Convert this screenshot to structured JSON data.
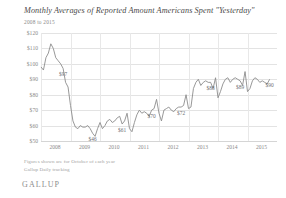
{
  "header": {
    "title": "Monthly Averages of Reported Amount Americans Spent \"Yesterday\"",
    "subtitle": "2008 to 2015"
  },
  "footer": {
    "note1": "Figures shown are for October of each year",
    "note2": "Gallup Daily tracking",
    "logo": "GALLUP"
  },
  "style": {
    "line_color": "#8c8c8c",
    "grid_color": "#e3e3e3",
    "text_color": "#6d6e71"
  },
  "chart_data": {
    "type": "line",
    "title": "Monthly Averages of Reported Amount Americans Spent \"Yesterday\"",
    "subtitle": "2008 to 2015",
    "xlabel": "",
    "ylabel": "",
    "ylim": [
      50,
      120
    ],
    "yticks": [
      50,
      60,
      70,
      80,
      90,
      100,
      110,
      120
    ],
    "ytick_labels": [
      "$50",
      "$60",
      "$70",
      "$80",
      "$90",
      "$100",
      "$110",
      "$120"
    ],
    "xticks": [
      2008,
      2009,
      2010,
      2011,
      2012,
      2013,
      2014,
      2015
    ],
    "xtick_labels": [
      "2008",
      "2009",
      "2010",
      "2011",
      "2012",
      "2013",
      "2014",
      "2015"
    ],
    "grid": "horizontal-and-vertical",
    "legend": "none",
    "series": [
      {
        "name": "Monthly average amount spent yesterday",
        "x": [
          2008.0,
          2008.083,
          2008.167,
          2008.25,
          2008.333,
          2008.417,
          2008.5,
          2008.583,
          2008.667,
          2008.75,
          2008.833,
          2008.917,
          2009.0,
          2009.083,
          2009.167,
          2009.25,
          2009.333,
          2009.417,
          2009.5,
          2009.583,
          2009.667,
          2009.75,
          2009.833,
          2009.917,
          2010.0,
          2010.083,
          2010.167,
          2010.25,
          2010.333,
          2010.417,
          2010.5,
          2010.583,
          2010.667,
          2010.75,
          2010.833,
          2010.917,
          2011.0,
          2011.083,
          2011.167,
          2011.25,
          2011.333,
          2011.417,
          2011.5,
          2011.583,
          2011.667,
          2011.75,
          2011.833,
          2011.917,
          2012.0,
          2012.083,
          2012.167,
          2012.25,
          2012.333,
          2012.417,
          2012.5,
          2012.583,
          2012.667,
          2012.75,
          2012.833,
          2012.917,
          2013.0,
          2013.083,
          2013.167,
          2013.25,
          2013.333,
          2013.417,
          2013.5,
          2013.583,
          2013.667,
          2013.75,
          2013.833,
          2013.917,
          2014.0,
          2014.083,
          2014.167,
          2014.25,
          2014.333,
          2014.417,
          2014.5,
          2014.583,
          2014.667,
          2014.75,
          2014.833,
          2014.917,
          2015.0,
          2015.083,
          2015.167,
          2015.25,
          2015.333,
          2015.417,
          2015.5,
          2015.583,
          2015.667,
          2015.75
        ],
        "values": [
          98,
          96,
          104,
          107,
          113,
          110,
          104,
          102,
          100,
          97,
          88,
          85,
          73,
          63,
          59,
          58,
          60,
          59,
          59,
          60,
          58,
          55,
          53,
          58,
          62,
          58,
          60,
          63,
          64,
          62,
          63,
          65,
          66,
          61,
          63,
          68,
          58,
          56,
          62,
          67,
          70,
          68,
          69,
          68,
          66,
          70,
          71,
          77,
          68,
          63,
          70,
          71,
          72,
          70,
          69,
          71,
          72,
          72,
          73,
          80,
          71,
          72,
          84,
          88,
          90,
          86,
          88,
          89,
          88,
          88,
          84,
          91,
          78,
          82,
          87,
          90,
          91,
          88,
          90,
          91,
          90,
          89,
          86,
          95,
          82,
          84,
          89,
          91,
          90,
          88,
          89,
          88,
          87,
          90
        ],
        "annotations": [
          {
            "x": 2008.75,
            "value": 97,
            "label": "$97"
          },
          {
            "x": 2009.75,
            "value": 55,
            "label": "$46"
          },
          {
            "x": 2010.75,
            "value": 61,
            "label": "$61"
          },
          {
            "x": 2011.75,
            "value": 70,
            "label": "$70"
          },
          {
            "x": 2012.75,
            "value": 72,
            "label": "$72"
          },
          {
            "x": 2013.75,
            "value": 88,
            "label": "$88"
          },
          {
            "x": 2014.75,
            "value": 89,
            "label": "$89"
          },
          {
            "x": 2015.75,
            "value": 90,
            "label": "$90"
          }
        ]
      }
    ]
  }
}
